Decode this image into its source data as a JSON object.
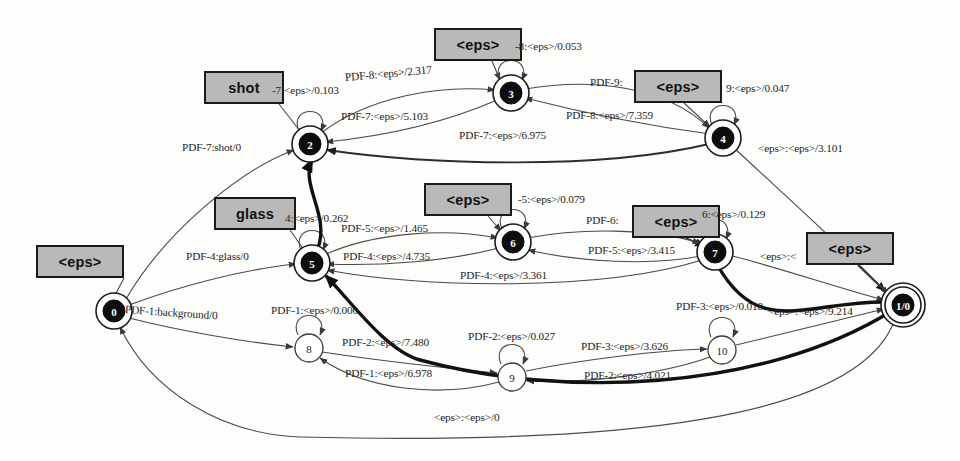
{
  "diagram": {
    "type": "finite-state-transducer",
    "width": 960,
    "height": 461,
    "background_color": "#fdfdfc",
    "symbol_box_fill": "#b9b9b9",
    "symbol_box_border": "#1a1a1a",
    "edge_color": "#4a4a4a",
    "highlight_edge_color": "#111111"
  },
  "states": [
    {
      "id": "0",
      "label": "0",
      "cx": 114,
      "cy": 311,
      "r": 14,
      "style": "filled",
      "final": false
    },
    {
      "id": "2",
      "label": "2",
      "cx": 310,
      "cy": 144,
      "r": 14,
      "style": "filled",
      "final": false
    },
    {
      "id": "3",
      "label": "3",
      "cx": 511,
      "cy": 93,
      "r": 14,
      "style": "filled",
      "final": false
    },
    {
      "id": "4",
      "label": "4",
      "cx": 723,
      "cy": 138,
      "r": 14,
      "style": "filled",
      "final": false
    },
    {
      "id": "5",
      "label": "5",
      "cx": 312,
      "cy": 263,
      "r": 14,
      "style": "filled",
      "final": false
    },
    {
      "id": "6",
      "label": "6",
      "cx": 513,
      "cy": 242,
      "r": 14,
      "style": "filled",
      "final": false
    },
    {
      "id": "7",
      "label": "7",
      "cx": 715,
      "cy": 252,
      "r": 14,
      "style": "filled",
      "final": false
    },
    {
      "id": "8",
      "label": "8",
      "cx": 309,
      "cy": 348,
      "r": 14,
      "style": "plain",
      "final": false
    },
    {
      "id": "9",
      "label": "9",
      "cx": 512,
      "cy": 377,
      "r": 14,
      "style": "plain",
      "final": false
    },
    {
      "id": "10",
      "label": "10",
      "cx": 722,
      "cy": 350,
      "r": 14,
      "style": "plain",
      "final": false
    },
    {
      "id": "1/0",
      "label": "1/0",
      "cx": 903,
      "cy": 305,
      "r": 14,
      "style": "filled",
      "final": true
    }
  ],
  "symbol_boxes": [
    {
      "text": "<eps>",
      "x": 36,
      "y": 245,
      "w": 88,
      "h": 33,
      "name": "symbol-box-eps-state0"
    },
    {
      "text": "shot",
      "x": 204,
      "y": 71,
      "w": 80,
      "h": 33,
      "name": "symbol-box-shot"
    },
    {
      "text": "<eps>",
      "x": 434,
      "y": 28,
      "w": 88,
      "h": 33,
      "name": "symbol-box-eps-state3"
    },
    {
      "text": "<eps>",
      "x": 634,
      "y": 70,
      "w": 88,
      "h": 33,
      "name": "symbol-box-eps-state4"
    },
    {
      "text": "glass",
      "x": 214,
      "y": 197,
      "w": 82,
      "h": 33,
      "name": "symbol-box-glass"
    },
    {
      "text": "<eps>",
      "x": 424,
      "y": 183,
      "w": 88,
      "h": 33,
      "name": "symbol-box-eps-state6"
    },
    {
      "text": "<eps>",
      "x": 632,
      "y": 205,
      "w": 88,
      "h": 33,
      "name": "symbol-box-eps-state7"
    },
    {
      "text": "<eps>",
      "x": 806,
      "y": 232,
      "w": 88,
      "h": 33,
      "name": "symbol-box-eps-final"
    }
  ],
  "edge_labels": [
    {
      "text": "PDF-7:shot/0",
      "x": 182,
      "y": 149,
      "rot": 0,
      "name": "edge-label-0-to-2"
    },
    {
      "text": "PDF-4:glass/0",
      "x": 186,
      "y": 258,
      "rot": 0,
      "name": "edge-label-0-to-5"
    },
    {
      "text": "PDF-1:background/0",
      "x": 125,
      "y": 311,
      "rot": 4,
      "name": "edge-label-0-to-8"
    },
    {
      "text": "-7:<eps>/0.103",
      "x": 272,
      "y": 92,
      "rot": 0,
      "name": "edge-label-loop-2"
    },
    {
      "text": "PDF-8:<eps>/2.317",
      "x": 345,
      "y": 79,
      "rot": -5,
      "name": "edge-label-2-to-3"
    },
    {
      "text": "PDF-7:<eps>/5.103",
      "x": 341,
      "y": 118,
      "rot": 0,
      "name": "edge-label-3-to-2"
    },
    {
      "text": "PDF-7:<eps>/6.975",
      "x": 459,
      "y": 137,
      "rot": 0,
      "name": "edge-label-4-to-2"
    },
    {
      "text": "-8:<eps>/0.053",
      "x": 515,
      "y": 48,
      "rot": 0,
      "name": "edge-label-loop-3"
    },
    {
      "text": "PDF-9:",
      "x": 590,
      "y": 84,
      "rot": 0,
      "name": "edge-label-3-to-4"
    },
    {
      "text": "PDF-8:<eps>/7.359",
      "x": 566,
      "y": 117,
      "rot": 0,
      "name": "edge-label-4-to-3"
    },
    {
      "text": "9:<eps>/0.047",
      "x": 726,
      "y": 90,
      "rot": 0,
      "name": "edge-label-loop-4"
    },
    {
      "text": "<eps>:<eps>/3.101",
      "x": 758,
      "y": 150,
      "rot": 0,
      "name": "edge-label-4-to-final"
    },
    {
      "text": "4:<eps>/0.262",
      "x": 285,
      "y": 220,
      "rot": 0,
      "name": "edge-label-loop-5"
    },
    {
      "text": "PDF-5:<eps>/1.465",
      "x": 341,
      "y": 230,
      "rot": 0,
      "name": "edge-label-5-to-6"
    },
    {
      "text": "PDF-4:<eps>/4.735",
      "x": 343,
      "y": 258,
      "rot": 0,
      "name": "edge-label-6-to-5"
    },
    {
      "text": "PDF-4:<eps>/3.361",
      "x": 460,
      "y": 277,
      "rot": 0,
      "name": "edge-label-7-to-5"
    },
    {
      "text": "-5:<eps>/0.079",
      "x": 518,
      "y": 201,
      "rot": 0,
      "name": "edge-label-loop-6"
    },
    {
      "text": "PDF-6:",
      "x": 586,
      "y": 222,
      "rot": 0,
      "name": "edge-label-6-to-7"
    },
    {
      "text": "PDF-5:<eps>/3.415",
      "x": 588,
      "y": 252,
      "rot": 0,
      "name": "edge-label-7-to-6"
    },
    {
      "text": "6:<eps>/0.129",
      "x": 702,
      "y": 216,
      "rot": 0,
      "name": "edge-label-loop-7"
    },
    {
      "text": "<eps>:<",
      "x": 760,
      "y": 258,
      "rot": 0,
      "name": "edge-label-7-to-final"
    },
    {
      "text": "PDF-1:<eps>/0.000",
      "x": 271,
      "y": 312,
      "rot": 0,
      "name": "edge-label-loop-8"
    },
    {
      "text": "PDF-2:<eps>/7.480",
      "x": 342,
      "y": 344,
      "rot": 0,
      "name": "edge-label-8-to-9"
    },
    {
      "text": "PDF-1:<eps>/6.978",
      "x": 345,
      "y": 375,
      "rot": 0,
      "name": "edge-label-9-to-8"
    },
    {
      "text": "PDF-2:<eps>/0.027",
      "x": 468,
      "y": 338,
      "rot": 0,
      "name": "edge-label-loop-9"
    },
    {
      "text": "PDF-3:<eps>/3.626",
      "x": 581,
      "y": 348,
      "rot": 0,
      "name": "edge-label-9-to-10"
    },
    {
      "text": "PDF-2:<eps>/4.021",
      "x": 584,
      "y": 377,
      "rot": 0,
      "name": "edge-label-10-to-9"
    },
    {
      "text": "PDF-3:<eps>/0.018",
      "x": 676,
      "y": 308,
      "rot": 0,
      "name": "edge-label-loop-10"
    },
    {
      "text": "<eps>:<eps>/9.214",
      "x": 768,
      "y": 313,
      "rot": 0,
      "name": "edge-label-10-to-final"
    },
    {
      "text": "<eps>:<eps>/0",
      "x": 434,
      "y": 419,
      "rot": 0,
      "name": "edge-label-final-to-0"
    }
  ],
  "transitions": [
    {
      "from": "0",
      "to": "2",
      "label": "PDF-7:shot/0"
    },
    {
      "from": "0",
      "to": "5",
      "label": "PDF-4:glass/0"
    },
    {
      "from": "0",
      "to": "8",
      "label": "PDF-1:background/0"
    },
    {
      "from": "2",
      "to": "2",
      "label": "PDF-7:<eps>/0.103"
    },
    {
      "from": "2",
      "to": "3",
      "label": "PDF-8:<eps>/2.317"
    },
    {
      "from": "3",
      "to": "2",
      "label": "PDF-7:<eps>/5.103"
    },
    {
      "from": "3",
      "to": "3",
      "label": "PDF-8:<eps>/0.053"
    },
    {
      "from": "3",
      "to": "4",
      "label": "PDF-9:<eps>/..."
    },
    {
      "from": "4",
      "to": "2",
      "label": "PDF-7:<eps>/6.975"
    },
    {
      "from": "4",
      "to": "3",
      "label": "PDF-8:<eps>/7.359"
    },
    {
      "from": "4",
      "to": "4",
      "label": "PDF-9:<eps>/0.047"
    },
    {
      "from": "4",
      "to": "1/0",
      "label": "<eps>:<eps>/3.101"
    },
    {
      "from": "5",
      "to": "5",
      "label": "PDF-4:<eps>/0.262"
    },
    {
      "from": "5",
      "to": "6",
      "label": "PDF-5:<eps>/1.465"
    },
    {
      "from": "6",
      "to": "5",
      "label": "PDF-4:<eps>/4.735"
    },
    {
      "from": "6",
      "to": "6",
      "label": "PDF-5:<eps>/0.079"
    },
    {
      "from": "6",
      "to": "7",
      "label": "PDF-6:<eps>/..."
    },
    {
      "from": "7",
      "to": "5",
      "label": "PDF-4:<eps>/3.361"
    },
    {
      "from": "7",
      "to": "6",
      "label": "PDF-5:<eps>/3.415"
    },
    {
      "from": "7",
      "to": "7",
      "label": "PDF-6:<eps>/0.129"
    },
    {
      "from": "7",
      "to": "1/0",
      "label": "<eps>:<eps>/..."
    },
    {
      "from": "8",
      "to": "8",
      "label": "PDF-1:<eps>/0.000"
    },
    {
      "from": "8",
      "to": "9",
      "label": "PDF-2:<eps>/7.480"
    },
    {
      "from": "9",
      "to": "8",
      "label": "PDF-1:<eps>/6.978"
    },
    {
      "from": "9",
      "to": "9",
      "label": "PDF-2:<eps>/0.027"
    },
    {
      "from": "9",
      "to": "10",
      "label": "PDF-3:<eps>/3.626"
    },
    {
      "from": "10",
      "to": "9",
      "label": "PDF-2:<eps>/4.021"
    },
    {
      "from": "10",
      "to": "10",
      "label": "PDF-3:<eps>/0.018"
    },
    {
      "from": "10",
      "to": "1/0",
      "label": "<eps>:<eps>/9.214"
    },
    {
      "from": "1/0",
      "to": "0",
      "label": "<eps>:<eps>/0"
    }
  ]
}
